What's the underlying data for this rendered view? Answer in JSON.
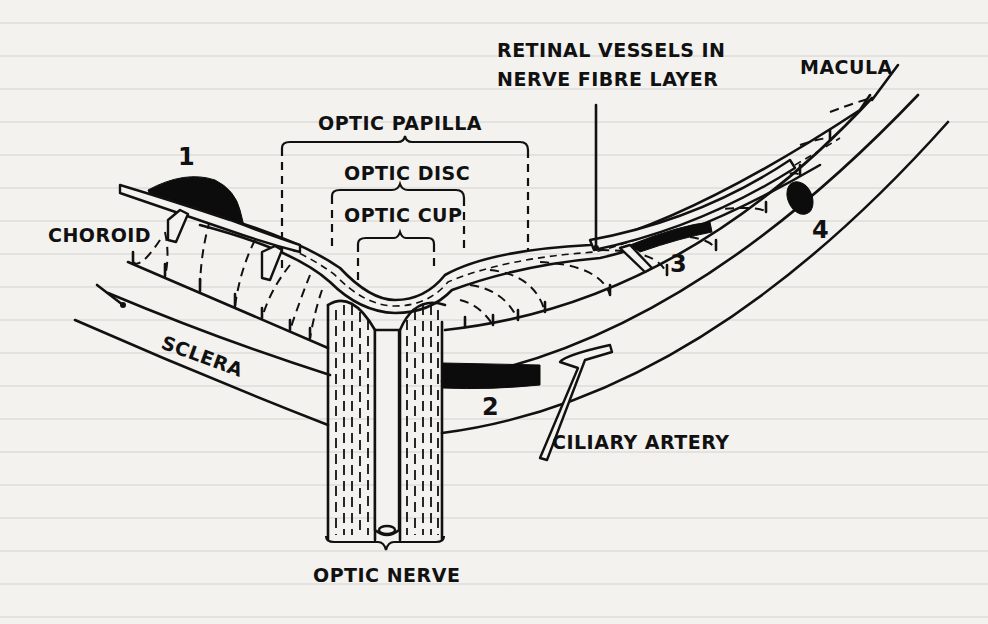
{
  "diagram": {
    "labels": {
      "retinal_vessels_line1": "RETINAL VESSELS IN",
      "retinal_vessels_line2": "NERVE FIBRE LAYER",
      "macula": "MACULA",
      "optic_papilla": "OPTIC PAPILLA",
      "optic_disc": "OPTIC DISC",
      "optic_cup": "OPTIC CUP",
      "choroid": "CHOROID",
      "sclera": "SCLERA",
      "ciliary_artery": "CILIARY ARTERY",
      "optic_nerve": "OPTIC NERVE"
    },
    "markers": [
      "1",
      "2",
      "3",
      "4"
    ],
    "colors": {
      "paper": "#f3f2ef",
      "ink": "#111111"
    }
  }
}
